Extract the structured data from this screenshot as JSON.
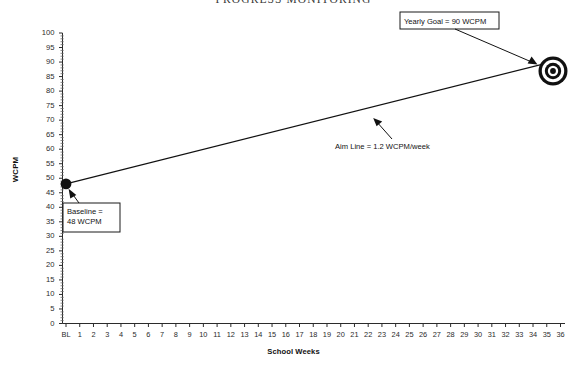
{
  "chart_data": {
    "type": "line",
    "title": "PROGRESS MONITORING",
    "xlabel": "School Weeks",
    "ylabel": "WCPM",
    "ylim": [
      0,
      100
    ],
    "ytick_step": 5,
    "yticks": [
      100,
      95,
      90,
      85,
      80,
      75,
      70,
      65,
      60,
      55,
      50,
      45,
      40,
      35,
      30,
      25,
      20,
      15,
      10,
      5,
      0
    ],
    "xticks": [
      "BL",
      "1",
      "2",
      "3",
      "4",
      "5",
      "6",
      "7",
      "8",
      "9",
      "10",
      "11",
      "12",
      "13",
      "14",
      "15",
      "16",
      "17",
      "18",
      "19",
      "20",
      "21",
      "22",
      "23",
      "24",
      "25",
      "26",
      "27",
      "28",
      "29",
      "30",
      "31",
      "32",
      "33",
      "34",
      "35",
      "36"
    ],
    "grid": false,
    "legend": "none",
    "series": [
      {
        "name": "Aim Line",
        "type": "line",
        "points": [
          {
            "x": "BL",
            "y": 48
          },
          {
            "x": "36",
            "y": 90
          }
        ]
      }
    ],
    "markers": [
      {
        "name": "baseline-point",
        "x": "BL",
        "y": 48,
        "style": "filled-circle"
      },
      {
        "name": "goal-point",
        "x": "36",
        "y": 90,
        "style": "bullseye-target"
      }
    ],
    "annotations": [
      {
        "name": "yearly-goal-callout",
        "text": "Yearly Goal = 90 WCPM",
        "points_to": "goal-point"
      },
      {
        "name": "baseline-callout",
        "line1": "Baseline =",
        "line2": "48 WCPM",
        "text": "Baseline = 48 WCPM",
        "points_to": "baseline-point"
      },
      {
        "name": "aim-line-callout",
        "text": "Aim Line = 1.2 WCPM/week",
        "points_to": "aim-line"
      }
    ],
    "colors": {
      "line": "#111111",
      "marker": "#111111",
      "axis": "#2b2b2b",
      "background": "#ffffff",
      "callout_border": "#1a1a1a"
    }
  }
}
